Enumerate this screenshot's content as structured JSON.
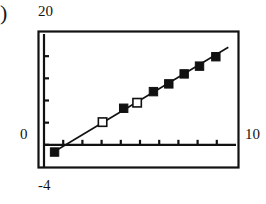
{
  "figure": {
    "panel_marker": ")",
    "labels": {
      "y_max": "20",
      "y_zero": "0",
      "y_min": "-4",
      "x_max": "10"
    }
  },
  "chart_data": {
    "type": "scatter",
    "title": "",
    "xlabel": "",
    "ylabel": "",
    "xlim": [
      0,
      10
    ],
    "ylim": [
      -4,
      20
    ],
    "grid": false,
    "legend": "none",
    "axis_style": "box-frame-with-inner-axes",
    "x_ticks": [
      1,
      2,
      3,
      4,
      5,
      6,
      7,
      8,
      9
    ],
    "y_ticks": [
      0,
      4,
      8,
      12,
      16
    ],
    "x_tick_labels": [
      "0",
      "10"
    ],
    "y_tick_labels": [
      "-4",
      "0",
      "20"
    ],
    "series": [
      {
        "name": "fit-line",
        "type": "line",
        "x": [
          0.35,
          9.6
        ],
        "y": [
          -1.6,
          17.6
        ]
      },
      {
        "name": "open-squares",
        "type": "scatter",
        "marker": "open-square",
        "x": [
          3.05,
          4.85
        ],
        "y": [
          4.1,
          7.6
        ]
      },
      {
        "name": "filled-squares",
        "type": "scatter",
        "marker": "filled-square",
        "x": [
          0.55,
          4.15,
          5.7,
          6.5,
          7.3,
          8.1,
          8.95
        ],
        "y": [
          -1.3,
          6.6,
          9.6,
          11.0,
          12.8,
          14.2,
          15.9
        ]
      }
    ]
  }
}
